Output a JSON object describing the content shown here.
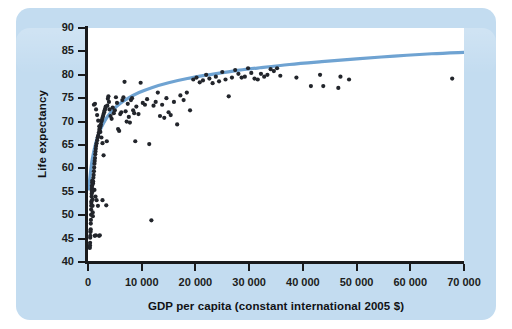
{
  "figure": {
    "background_color": "#c3dcf0",
    "plot_background_color": "#ffffff",
    "axis_color": "#191a1c",
    "marker_color": "#22252b",
    "trend_color": "#6fa3d2"
  },
  "chart_data": {
    "type": "scatter",
    "title": "",
    "subtitle": "",
    "xlabel": "GDP per capita (constant international 2005 $)",
    "ylabel": "Life expectancy",
    "xlim": [
      0,
      70000
    ],
    "ylim": [
      40,
      90
    ],
    "xticks": [
      0,
      10000,
      20000,
      30000,
      40000,
      50000,
      60000,
      70000
    ],
    "xtick_labels": [
      "0",
      "10 000",
      "20 000",
      "30 000",
      "40 000",
      "50 000",
      "60 000",
      "70 000"
    ],
    "yticks": [
      40,
      45,
      50,
      55,
      60,
      65,
      70,
      75,
      80,
      85,
      90
    ],
    "ytick_labels": [
      "40",
      "45",
      "50",
      "55",
      "60",
      "65",
      "70",
      "75",
      "80",
      "85",
      "90"
    ],
    "grid": false,
    "legend": false,
    "legend_position": "none",
    "annotations": [],
    "series": [
      {
        "name": "Countries",
        "marker": "circle",
        "color": "#22252b",
        "points": [
          [
            300,
            43.2
          ],
          [
            330,
            43.0
          ],
          [
            360,
            43.6
          ],
          [
            390,
            44.1
          ],
          [
            410,
            45.2
          ],
          [
            430,
            45.6
          ],
          [
            450,
            46.4
          ],
          [
            470,
            46.6
          ],
          [
            500,
            47.0
          ],
          [
            520,
            48.2
          ],
          [
            540,
            49.0
          ],
          [
            560,
            50.1
          ],
          [
            580,
            51.2
          ],
          [
            600,
            52.0
          ],
          [
            620,
            52.6
          ],
          [
            650,
            53.0
          ],
          [
            670,
            54.0
          ],
          [
            690,
            54.6
          ],
          [
            700,
            55.2
          ],
          [
            720,
            55.6
          ],
          [
            740,
            56.0
          ],
          [
            760,
            56.4
          ],
          [
            780,
            57.0
          ],
          [
            800,
            57.4
          ],
          [
            820,
            55.0
          ],
          [
            840,
            53.4
          ],
          [
            860,
            52.0
          ],
          [
            880,
            50.6
          ],
          [
            900,
            49.8
          ],
          [
            930,
            56.8
          ],
          [
            960,
            57.2
          ],
          [
            1000,
            58.0
          ],
          [
            1050,
            58.6
          ],
          [
            1100,
            59.4
          ],
          [
            1150,
            60.2
          ],
          [
            1200,
            61.0
          ],
          [
            1250,
            61.6
          ],
          [
            1300,
            62.2
          ],
          [
            1350,
            63.0
          ],
          [
            1400,
            63.6
          ],
          [
            1450,
            64.2
          ],
          [
            1500,
            64.8
          ],
          [
            1600,
            65.4
          ],
          [
            1700,
            66.0
          ],
          [
            1800,
            66.6
          ],
          [
            1900,
            67.0
          ],
          [
            2000,
            67.6
          ],
          [
            2100,
            68.2
          ],
          [
            2200,
            68.6
          ],
          [
            2300,
            69.0
          ],
          [
            2400,
            69.4
          ],
          [
            2500,
            70.0
          ],
          [
            2600,
            70.4
          ],
          [
            2700,
            70.8
          ],
          [
            2800,
            71.2
          ],
          [
            2900,
            71.6
          ],
          [
            3000,
            72.0
          ],
          [
            3100,
            72.4
          ],
          [
            3200,
            72.8
          ],
          [
            3300,
            73.2
          ],
          [
            1100,
            73.6
          ],
          [
            1300,
            73.8
          ],
          [
            1500,
            72.6
          ],
          [
            1700,
            71.4
          ],
          [
            1900,
            70.2
          ],
          [
            2100,
            69.0
          ],
          [
            2300,
            67.8
          ],
          [
            2500,
            66.6
          ],
          [
            2700,
            65.4
          ],
          [
            1200,
            55.4
          ],
          [
            1400,
            54.0
          ],
          [
            1600,
            53.2
          ],
          [
            1850,
            52.0
          ],
          [
            1250,
            45.6
          ],
          [
            1450,
            45.7
          ],
          [
            2050,
            45.6
          ],
          [
            2200,
            45.7
          ],
          [
            2700,
            53.2
          ],
          [
            3400,
            52.1
          ],
          [
            2900,
            62.8
          ],
          [
            3500,
            65.8
          ],
          [
            3600,
            73.4
          ],
          [
            3700,
            74.9
          ],
          [
            3800,
            75.4
          ],
          [
            3900,
            74.2
          ],
          [
            4000,
            72.6
          ],
          [
            4200,
            71.2
          ],
          [
            4400,
            70.6
          ],
          [
            4600,
            73.0
          ],
          [
            4800,
            71.8
          ],
          [
            5000,
            72.4
          ],
          [
            5200,
            75.2
          ],
          [
            5400,
            74.0
          ],
          [
            5600,
            68.4
          ],
          [
            5800,
            68.0
          ],
          [
            6000,
            71.6
          ],
          [
            6200,
            72.0
          ],
          [
            6400,
            74.6
          ],
          [
            6600,
            75.2
          ],
          [
            6800,
            78.5
          ],
          [
            7000,
            72.2
          ],
          [
            7200,
            70.0
          ],
          [
            7400,
            73.8
          ],
          [
            7600,
            71.0
          ],
          [
            7800,
            69.8
          ],
          [
            8000,
            74.6
          ],
          [
            8200,
            75.0
          ],
          [
            8400,
            72.4
          ],
          [
            8600,
            71.8
          ],
          [
            8800,
            65.8
          ],
          [
            9000,
            73.2
          ],
          [
            9400,
            71.6
          ],
          [
            9800,
            78.3
          ],
          [
            10200,
            74.0
          ],
          [
            10600,
            73.6
          ],
          [
            11000,
            74.8
          ],
          [
            11400,
            65.2
          ],
          [
            11800,
            48.9
          ],
          [
            12200,
            73.4
          ],
          [
            12600,
            74.2
          ],
          [
            13000,
            76.2
          ],
          [
            13400,
            71.2
          ],
          [
            13800,
            73.6
          ],
          [
            14200,
            70.8
          ],
          [
            14600,
            75.0
          ],
          [
            15000,
            72.0
          ],
          [
            15400,
            71.4
          ],
          [
            16000,
            74.2
          ],
          [
            16600,
            69.4
          ],
          [
            17200,
            75.6
          ],
          [
            17800,
            74.6
          ],
          [
            18400,
            76.2
          ],
          [
            19000,
            72.4
          ],
          [
            19600,
            79.0
          ],
          [
            20200,
            79.4
          ],
          [
            20800,
            78.4
          ],
          [
            21400,
            78.8
          ],
          [
            22000,
            80.0
          ],
          [
            22600,
            79.2
          ],
          [
            23200,
            78.2
          ],
          [
            23800,
            79.6
          ],
          [
            24400,
            78.6
          ],
          [
            25000,
            80.6
          ],
          [
            25600,
            79.0
          ],
          [
            26200,
            75.4
          ],
          [
            26800,
            79.4
          ],
          [
            27400,
            81.0
          ],
          [
            28000,
            80.2
          ],
          [
            28600,
            79.4
          ],
          [
            29200,
            79.6
          ],
          [
            29800,
            81.4
          ],
          [
            30400,
            80.4
          ],
          [
            31000,
            79.2
          ],
          [
            31600,
            79.0
          ],
          [
            32200,
            80.2
          ],
          [
            32800,
            79.6
          ],
          [
            33400,
            80.0
          ],
          [
            34000,
            81.2
          ],
          [
            34600,
            80.8
          ],
          [
            35200,
            81.4
          ],
          [
            35800,
            79.8
          ],
          [
            38800,
            79.4
          ],
          [
            41500,
            77.6
          ],
          [
            43200,
            80.0
          ],
          [
            43800,
            77.6
          ],
          [
            46600,
            77.2
          ],
          [
            47000,
            79.6
          ],
          [
            48600,
            79.0
          ],
          [
            67800,
            79.2
          ]
        ]
      }
    ],
    "trend_line": {
      "name": "Fitted logarithmic curve",
      "color": "#6fa3d2",
      "points": [
        [
          150,
          55.6
        ],
        [
          400,
          58.5
        ],
        [
          800,
          62.0
        ],
        [
          1400,
          65.2
        ],
        [
          2200,
          68.0
        ],
        [
          3200,
          70.3
        ],
        [
          4400,
          72.2
        ],
        [
          5800,
          73.7
        ],
        [
          7500,
          75.0
        ],
        [
          9500,
          76.2
        ],
        [
          12000,
          77.3
        ],
        [
          15000,
          78.3
        ],
        [
          18500,
          79.2
        ],
        [
          22500,
          80.0
        ],
        [
          27000,
          80.8
        ],
        [
          32000,
          81.5
        ],
        [
          37500,
          82.2
        ],
        [
          43500,
          82.8
        ],
        [
          50000,
          83.4
        ],
        [
          57000,
          84.0
        ],
        [
          64000,
          84.5
        ],
        [
          70000,
          84.8
        ]
      ]
    }
  }
}
